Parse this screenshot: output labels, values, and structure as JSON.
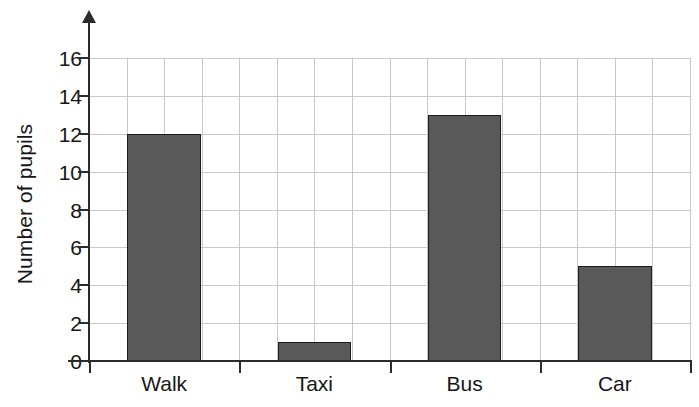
{
  "chart_data": {
    "type": "bar",
    "title": "",
    "subtitle": "",
    "xlabel": "",
    "ylabel": "Number of pupils",
    "categories": [
      "Walk",
      "Taxi",
      "Bus",
      "Car"
    ],
    "values": [
      12,
      1,
      13,
      5
    ],
    "ylim": [
      0,
      16
    ],
    "ytick_step": 2,
    "yticks": [
      0,
      2,
      4,
      6,
      8,
      10,
      12,
      14,
      16
    ],
    "ytick_labels": [
      "0",
      "2",
      "4",
      "6",
      "8",
      "10",
      "12",
      "14",
      "16"
    ],
    "grid": true,
    "grid_axis": "both",
    "legend": false,
    "legend_position": "none",
    "annotations": [],
    "bar_color": "#595959",
    "bar_edge_color": "#1c1c1c",
    "grid_color": "#c9c9c9",
    "axis_color": "#2b2b2b",
    "background_color": "#ffffff",
    "text_color": "#161616",
    "y_axis_has_arrow": true,
    "vertical_gridline_count": 16
  }
}
